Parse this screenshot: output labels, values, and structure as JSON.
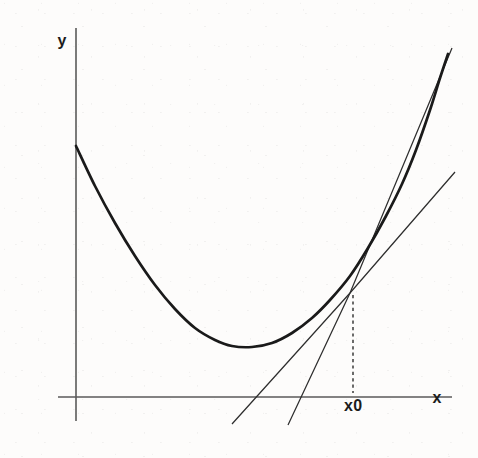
{
  "figure": {
    "background_color": "#fdfcfb",
    "curve_color": "#1a1a1a",
    "axis_color": "#5a5a5a",
    "line_color": "#2e2e2e"
  },
  "labels": {
    "y_axis": "y",
    "x_axis": "x",
    "tangent_point": "x0"
  },
  "chart_data": {
    "type": "line",
    "title": "",
    "subtitle": "",
    "xlabel": "x",
    "ylabel": "y",
    "grid": false,
    "legend": null,
    "axes": {
      "x_axis": {
        "label": "x",
        "pixel_y": 397,
        "pixel_x_start": 58,
        "pixel_x_end": 452,
        "arrow": false
      },
      "y_axis": {
        "label": "y",
        "pixel_x": 76,
        "pixel_y_start": 28,
        "pixel_y_end": 421,
        "arrow": false
      }
    },
    "annotations": [
      {
        "text": "x0",
        "pixel_x": 353,
        "pixel_y": 406,
        "describes": "abscissa of tangency point"
      },
      {
        "text": "y",
        "pixel_x": 62,
        "pixel_y": 41,
        "describes": "y axis label"
      },
      {
        "text": "x",
        "pixel_x": 437,
        "pixel_y": 398,
        "describes": "x axis label"
      }
    ],
    "series": [
      {
        "name": "parabola",
        "type": "curve",
        "role": "objective function f(x)",
        "stroke_width": 2.7,
        "points": [
          [
            76,
            146
          ],
          [
            95,
            186
          ],
          [
            115,
            223
          ],
          [
            135,
            256
          ],
          [
            155,
            285
          ],
          [
            175,
            309
          ],
          [
            195,
            328
          ],
          [
            215,
            340
          ],
          [
            232,
            346
          ],
          [
            252,
            347
          ],
          [
            272,
            343
          ],
          [
            292,
            333
          ],
          [
            312,
            318
          ],
          [
            330,
            300
          ],
          [
            350,
            276
          ],
          [
            368,
            248
          ],
          [
            386,
            216
          ],
          [
            402,
            184
          ],
          [
            416,
            150
          ],
          [
            430,
            110
          ],
          [
            440,
            78
          ],
          [
            448,
            54
          ]
        ]
      },
      {
        "name": "tangent-line",
        "type": "line",
        "role": "tangent to curve at x0",
        "stroke_width": 1.25,
        "points": [
          [
            288,
            425
          ],
          [
            350,
            293
          ],
          [
            452,
            48
          ]
        ]
      },
      {
        "name": "secant-line-steep",
        "type": "line",
        "role": "secant/chord through x0",
        "stroke_width": 1.25,
        "points": [
          [
            232,
            424
          ],
          [
            350,
            293
          ],
          [
            455,
            172
          ]
        ]
      },
      {
        "name": "drop-line",
        "type": "dashed",
        "role": "vertical dashed drop from tangency point to x axis",
        "stroke_width": 1.5,
        "dash": "3.2 3.2",
        "points": [
          [
            353,
            295
          ],
          [
            353,
            393
          ]
        ]
      }
    ],
    "key_points": [
      {
        "name": "y-intercept",
        "pixel": [
          76,
          146
        ]
      },
      {
        "name": "vertex",
        "pixel": [
          252,
          347
        ]
      },
      {
        "name": "tangency-point-x0",
        "pixel": [
          350,
          293
        ]
      }
    ]
  }
}
